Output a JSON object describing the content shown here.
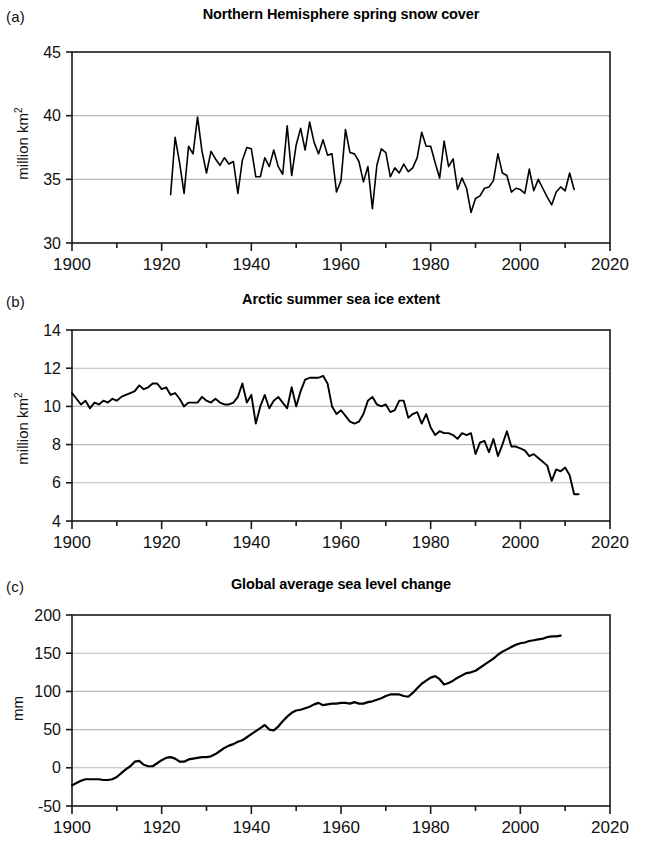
{
  "figure": {
    "side_note": "Evidence for climate change"
  },
  "panels": [
    {
      "tag": "(a)",
      "title": "Northern Hemisphere spring snow cover",
      "ylabel_main": "million km",
      "ylabel_sup": "2"
    },
    {
      "tag": "(b)",
      "title": "Arctic summer sea ice extent",
      "ylabel_main": "million km",
      "ylabel_sup": "2"
    },
    {
      "tag": "(c)",
      "title": "Global average sea level change",
      "ylabel_main": "mm",
      "ylabel_sup": ""
    }
  ],
  "chart_data": [
    {
      "type": "line",
      "panel": "a",
      "title": "Northern Hemisphere spring snow cover",
      "xlabel": "",
      "ylabel": "million km2",
      "xlim": [
        1900,
        2020
      ],
      "ylim": [
        30,
        45
      ],
      "xticks": [
        1900,
        1920,
        1940,
        1960,
        1980,
        2000,
        2020
      ],
      "yticks": [
        30,
        35,
        40,
        45
      ],
      "minor_xtick_step": 10,
      "grid": "horizontal",
      "legend": "none",
      "line_color": "#000000",
      "x": [
        1922,
        1923,
        1924,
        1925,
        1926,
        1927,
        1928,
        1929,
        1930,
        1931,
        1932,
        1933,
        1934,
        1935,
        1936,
        1937,
        1938,
        1939,
        1940,
        1941,
        1942,
        1943,
        1944,
        1945,
        1946,
        1947,
        1948,
        1949,
        1950,
        1951,
        1952,
        1953,
        1954,
        1955,
        1956,
        1957,
        1958,
        1959,
        1960,
        1961,
        1962,
        1963,
        1964,
        1965,
        1966,
        1967,
        1968,
        1969,
        1970,
        1971,
        1972,
        1973,
        1974,
        1975,
        1976,
        1977,
        1978,
        1979,
        1980,
        1981,
        1982,
        1983,
        1984,
        1985,
        1986,
        1987,
        1988,
        1989,
        1990,
        1991,
        1992,
        1993,
        1994,
        1995,
        1996,
        1997,
        1998,
        1999,
        2000,
        2001,
        2002,
        2003,
        2004,
        2005,
        2006,
        2007,
        2008,
        2009,
        2010,
        2011,
        2012
      ],
      "values": [
        33.8,
        38.3,
        36.3,
        33.9,
        37.6,
        37.0,
        39.9,
        37.2,
        35.5,
        37.2,
        36.6,
        36.1,
        36.7,
        36.2,
        36.4,
        33.9,
        36.5,
        37.5,
        37.4,
        35.2,
        35.2,
        36.7,
        36.0,
        37.3,
        36.0,
        35.4,
        39.2,
        35.3,
        37.7,
        39.0,
        37.3,
        39.5,
        37.9,
        37.0,
        38.1,
        36.9,
        37.0,
        34.0,
        34.9,
        38.9,
        37.1,
        37.0,
        36.4,
        34.8,
        36.0,
        32.7,
        36.1,
        37.4,
        37.1,
        35.2,
        35.9,
        35.5,
        36.2,
        35.6,
        35.9,
        36.7,
        38.7,
        37.6,
        37.6,
        36.3,
        35.1,
        38.0,
        36.0,
        36.6,
        34.2,
        35.1,
        34.3,
        32.4,
        33.5,
        33.7,
        34.3,
        34.4,
        34.9,
        37.0,
        35.5,
        35.3,
        34.0,
        34.3,
        34.2,
        33.9,
        35.8,
        34.1,
        35.0,
        34.3,
        33.6,
        33.0,
        34.0,
        34.4,
        34.1,
        35.5,
        34.2
      ]
    },
    {
      "type": "line",
      "panel": "b",
      "title": "Arctic summer sea ice extent",
      "xlabel": "",
      "ylabel": "million km2",
      "xlim": [
        1900,
        2020
      ],
      "ylim": [
        4,
        14
      ],
      "xticks": [
        1900,
        1920,
        1940,
        1960,
        1980,
        2000,
        2020
      ],
      "yticks": [
        4,
        6,
        8,
        10,
        12,
        14
      ],
      "minor_xtick_step": 10,
      "grid": "horizontal",
      "legend": "none",
      "line_color": "#000000",
      "x": [
        1900,
        1901,
        1902,
        1903,
        1904,
        1905,
        1906,
        1907,
        1908,
        1909,
        1910,
        1911,
        1912,
        1913,
        1914,
        1915,
        1916,
        1917,
        1918,
        1919,
        1920,
        1921,
        1922,
        1923,
        1924,
        1925,
        1926,
        1927,
        1928,
        1929,
        1930,
        1931,
        1932,
        1933,
        1934,
        1935,
        1936,
        1937,
        1938,
        1939,
        1940,
        1941,
        1942,
        1943,
        1944,
        1945,
        1946,
        1947,
        1948,
        1949,
        1950,
        1951,
        1952,
        1953,
        1954,
        1955,
        1956,
        1957,
        1958,
        1959,
        1960,
        1961,
        1962,
        1963,
        1964,
        1965,
        1966,
        1967,
        1968,
        1969,
        1970,
        1971,
        1972,
        1973,
        1974,
        1975,
        1976,
        1977,
        1978,
        1979,
        1980,
        1981,
        1982,
        1983,
        1984,
        1985,
        1986,
        1987,
        1988,
        1989,
        1990,
        1991,
        1992,
        1993,
        1994,
        1995,
        1996,
        1997,
        1998,
        1999,
        2000,
        2001,
        2002,
        2003,
        2004,
        2005,
        2006,
        2007,
        2008,
        2009,
        2010,
        2011,
        2012,
        2013
      ],
      "values": [
        10.7,
        10.4,
        10.1,
        10.3,
        9.9,
        10.2,
        10.1,
        10.3,
        10.2,
        10.4,
        10.3,
        10.5,
        10.6,
        10.7,
        10.8,
        11.1,
        10.9,
        11.0,
        11.2,
        11.2,
        10.9,
        11.0,
        10.6,
        10.7,
        10.4,
        10.0,
        10.2,
        10.2,
        10.2,
        10.5,
        10.3,
        10.2,
        10.4,
        10.2,
        10.1,
        10.1,
        10.2,
        10.5,
        11.2,
        10.2,
        10.6,
        9.1,
        10.0,
        10.6,
        9.9,
        10.3,
        10.5,
        10.2,
        9.9,
        11.0,
        10.0,
        10.8,
        11.4,
        11.5,
        11.5,
        11.5,
        11.6,
        11.2,
        10.0,
        9.6,
        9.8,
        9.5,
        9.2,
        9.1,
        9.2,
        9.6,
        10.3,
        10.5,
        10.1,
        10.0,
        10.1,
        9.7,
        9.8,
        10.3,
        10.3,
        9.4,
        9.6,
        9.7,
        9.1,
        9.6,
        8.9,
        8.5,
        8.7,
        8.6,
        8.6,
        8.5,
        8.3,
        8.6,
        8.5,
        8.6,
        7.5,
        8.1,
        8.2,
        7.6,
        8.3,
        7.4,
        8.0,
        8.7,
        7.9,
        7.9,
        7.8,
        7.7,
        7.4,
        7.5,
        7.3,
        7.1,
        6.9,
        6.1,
        6.7,
        6.6,
        6.8,
        6.4,
        5.4,
        5.4
      ]
    },
    {
      "type": "line",
      "panel": "c",
      "title": "Global average sea level change",
      "xlabel": "",
      "ylabel": "mm",
      "xlim": [
        1900,
        2020
      ],
      "ylim": [
        -50,
        200
      ],
      "xticks": [
        1900,
        1920,
        1940,
        1960,
        1980,
        2000,
        2020
      ],
      "yticks": [
        -50,
        0,
        50,
        100,
        150,
        200
      ],
      "minor_xtick_step": 10,
      "grid": "horizontal",
      "legend": "none",
      "line_color": "#000000",
      "x": [
        1900,
        1901,
        1902,
        1903,
        1904,
        1905,
        1906,
        1907,
        1908,
        1909,
        1910,
        1911,
        1912,
        1913,
        1914,
        1915,
        1916,
        1917,
        1918,
        1919,
        1920,
        1921,
        1922,
        1923,
        1924,
        1925,
        1926,
        1927,
        1928,
        1929,
        1930,
        1931,
        1932,
        1933,
        1934,
        1935,
        1936,
        1937,
        1938,
        1939,
        1940,
        1941,
        1942,
        1943,
        1944,
        1945,
        1946,
        1947,
        1948,
        1949,
        1950,
        1951,
        1952,
        1953,
        1954,
        1955,
        1956,
        1957,
        1958,
        1959,
        1960,
        1961,
        1962,
        1963,
        1964,
        1965,
        1966,
        1967,
        1968,
        1969,
        1970,
        1971,
        1972,
        1973,
        1974,
        1975,
        1976,
        1977,
        1978,
        1979,
        1980,
        1981,
        1982,
        1983,
        1984,
        1985,
        1986,
        1987,
        1988,
        1989,
        1990,
        1991,
        1992,
        1993,
        1994,
        1995,
        1996,
        1997,
        1998,
        1999,
        2000,
        2001,
        2002,
        2003,
        2004,
        2005,
        2006,
        2007,
        2008,
        2009
      ],
      "values": [
        -23,
        -20,
        -17,
        -15,
        -15,
        -15,
        -15,
        -16,
        -16,
        -15,
        -12,
        -7,
        -2,
        2,
        8,
        9,
        4,
        2,
        2,
        6,
        10,
        13,
        14,
        12,
        8,
        8,
        11,
        12,
        13,
        14,
        14,
        15,
        18,
        22,
        26,
        29,
        31,
        34,
        36,
        40,
        44,
        48,
        52,
        56,
        50,
        49,
        54,
        61,
        67,
        72,
        75,
        76,
        78,
        80,
        83,
        85,
        82,
        83,
        84,
        84,
        85,
        85,
        84,
        86,
        84,
        84,
        86,
        87,
        89,
        91,
        94,
        96,
        96,
        96,
        94,
        93,
        98,
        104,
        110,
        114,
        118,
        120,
        116,
        109,
        111,
        114,
        118,
        121,
        124,
        125,
        127,
        131,
        135,
        139,
        143,
        148,
        152,
        155,
        158,
        161,
        163,
        164,
        166,
        167,
        168,
        169,
        171,
        172,
        172,
        173
      ]
    }
  ]
}
